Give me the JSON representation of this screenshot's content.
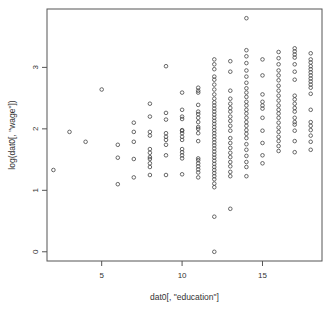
{
  "chart_data": {
    "type": "scatter",
    "title": "",
    "xlabel": "dat0[, \"education\"]",
    "ylabel": "log(dat0[, \"wage\"])",
    "xlim": [
      1.6,
      18.7
    ],
    "ylim": [
      -0.15,
      3.95
    ],
    "x_ticks": [
      5,
      10,
      15
    ],
    "x_tick_labels": [
      "5",
      "10",
      "15"
    ],
    "y_ticks": [
      0,
      1,
      2,
      3
    ],
    "y_tick_labels": [
      "0",
      "1",
      "2",
      "3"
    ],
    "grid": false,
    "legend": "none",
    "marker": "open-circle",
    "marker_color": "#444444",
    "points": [
      {
        "x": 2,
        "y": 1.33
      },
      {
        "x": 3,
        "y": 1.95
      },
      {
        "x": 4,
        "y": 1.79
      },
      {
        "x": 5,
        "y": 2.64
      },
      {
        "x": 6,
        "y": 1.74
      },
      {
        "x": 6,
        "y": 1.53
      },
      {
        "x": 6,
        "y": 1.1
      },
      {
        "x": 7,
        "y": 2.1
      },
      {
        "x": 7,
        "y": 1.95
      },
      {
        "x": 7,
        "y": 1.79
      },
      {
        "x": 7,
        "y": 1.51
      },
      {
        "x": 7,
        "y": 1.21
      },
      {
        "x": 8,
        "y": 2.41
      },
      {
        "x": 8,
        "y": 2.2
      },
      {
        "x": 8,
        "y": 1.95
      },
      {
        "x": 8,
        "y": 1.89
      },
      {
        "x": 8,
        "y": 1.67
      },
      {
        "x": 8,
        "y": 1.61
      },
      {
        "x": 8,
        "y": 1.54
      },
      {
        "x": 8,
        "y": 1.51
      },
      {
        "x": 8,
        "y": 1.44
      },
      {
        "x": 8,
        "y": 1.38
      },
      {
        "x": 8,
        "y": 1.25
      },
      {
        "x": 9,
        "y": 3.02
      },
      {
        "x": 9,
        "y": 2.26
      },
      {
        "x": 9,
        "y": 2.15
      },
      {
        "x": 9,
        "y": 1.93
      },
      {
        "x": 9,
        "y": 1.87
      },
      {
        "x": 9,
        "y": 1.82
      },
      {
        "x": 9,
        "y": 1.74
      },
      {
        "x": 9,
        "y": 1.57
      },
      {
        "x": 9,
        "y": 1.25
      },
      {
        "x": 10,
        "y": 2.59
      },
      {
        "x": 10,
        "y": 2.31
      },
      {
        "x": 10,
        "y": 2.2
      },
      {
        "x": 10,
        "y": 2.16
      },
      {
        "x": 10,
        "y": 1.98
      },
      {
        "x": 10,
        "y": 1.97
      },
      {
        "x": 10,
        "y": 1.93
      },
      {
        "x": 10,
        "y": 1.87
      },
      {
        "x": 10,
        "y": 1.82
      },
      {
        "x": 10,
        "y": 1.67
      },
      {
        "x": 10,
        "y": 1.62
      },
      {
        "x": 10,
        "y": 1.57
      },
      {
        "x": 10,
        "y": 1.52
      },
      {
        "x": 10,
        "y": 1.26
      },
      {
        "x": 11,
        "y": 2.67
      },
      {
        "x": 11,
        "y": 2.62
      },
      {
        "x": 11,
        "y": 2.59
      },
      {
        "x": 11,
        "y": 2.39
      },
      {
        "x": 11,
        "y": 2.28
      },
      {
        "x": 11,
        "y": 2.24
      },
      {
        "x": 11,
        "y": 2.18
      },
      {
        "x": 11,
        "y": 2.11
      },
      {
        "x": 11,
        "y": 2.03
      },
      {
        "x": 11,
        "y": 2.0
      },
      {
        "x": 11,
        "y": 1.93
      },
      {
        "x": 11,
        "y": 1.8
      },
      {
        "x": 11,
        "y": 1.52
      },
      {
        "x": 11,
        "y": 1.49
      },
      {
        "x": 11,
        "y": 1.44
      },
      {
        "x": 11,
        "y": 1.39
      },
      {
        "x": 11,
        "y": 1.34
      },
      {
        "x": 11,
        "y": 1.29
      },
      {
        "x": 11,
        "y": 1.21
      },
      {
        "x": 12,
        "y": 3.13
      },
      {
        "x": 12,
        "y": 3.05
      },
      {
        "x": 12,
        "y": 2.97
      },
      {
        "x": 12,
        "y": 2.85
      },
      {
        "x": 12,
        "y": 2.8
      },
      {
        "x": 12,
        "y": 2.72
      },
      {
        "x": 12,
        "y": 2.64
      },
      {
        "x": 12,
        "y": 2.56
      },
      {
        "x": 12,
        "y": 2.49
      },
      {
        "x": 12,
        "y": 2.43
      },
      {
        "x": 12,
        "y": 2.38
      },
      {
        "x": 12,
        "y": 2.33
      },
      {
        "x": 12,
        "y": 2.28
      },
      {
        "x": 12,
        "y": 2.23
      },
      {
        "x": 12,
        "y": 2.18
      },
      {
        "x": 12,
        "y": 2.13
      },
      {
        "x": 12,
        "y": 2.08
      },
      {
        "x": 12,
        "y": 2.03
      },
      {
        "x": 12,
        "y": 1.98
      },
      {
        "x": 12,
        "y": 1.93
      },
      {
        "x": 12,
        "y": 1.88
      },
      {
        "x": 12,
        "y": 1.83
      },
      {
        "x": 12,
        "y": 1.78
      },
      {
        "x": 12,
        "y": 1.73
      },
      {
        "x": 12,
        "y": 1.68
      },
      {
        "x": 12,
        "y": 1.63
      },
      {
        "x": 12,
        "y": 1.58
      },
      {
        "x": 12,
        "y": 1.53
      },
      {
        "x": 12,
        "y": 1.48
      },
      {
        "x": 12,
        "y": 1.43
      },
      {
        "x": 12,
        "y": 1.38
      },
      {
        "x": 12,
        "y": 1.33
      },
      {
        "x": 12,
        "y": 1.28
      },
      {
        "x": 12,
        "y": 1.23
      },
      {
        "x": 12,
        "y": 1.18
      },
      {
        "x": 12,
        "y": 1.11
      },
      {
        "x": 12,
        "y": 1.05
      },
      {
        "x": 12,
        "y": 0.57
      },
      {
        "x": 12,
        "y": 0.0
      },
      {
        "x": 13,
        "y": 3.1
      },
      {
        "x": 13,
        "y": 2.93
      },
      {
        "x": 13,
        "y": 2.62
      },
      {
        "x": 13,
        "y": 2.49
      },
      {
        "x": 13,
        "y": 2.41
      },
      {
        "x": 13,
        "y": 2.34
      },
      {
        "x": 13,
        "y": 2.28
      },
      {
        "x": 13,
        "y": 2.2
      },
      {
        "x": 13,
        "y": 2.13
      },
      {
        "x": 13,
        "y": 2.05
      },
      {
        "x": 13,
        "y": 1.97
      },
      {
        "x": 13,
        "y": 1.85
      },
      {
        "x": 13,
        "y": 1.77
      },
      {
        "x": 13,
        "y": 1.69
      },
      {
        "x": 13,
        "y": 1.61
      },
      {
        "x": 13,
        "y": 1.54
      },
      {
        "x": 13,
        "y": 1.46
      },
      {
        "x": 13,
        "y": 1.39
      },
      {
        "x": 13,
        "y": 1.3
      },
      {
        "x": 13,
        "y": 1.23
      },
      {
        "x": 13,
        "y": 0.7
      },
      {
        "x": 14,
        "y": 3.8
      },
      {
        "x": 14,
        "y": 3.28
      },
      {
        "x": 14,
        "y": 3.18
      },
      {
        "x": 14,
        "y": 3.07
      },
      {
        "x": 14,
        "y": 2.95
      },
      {
        "x": 14,
        "y": 2.85
      },
      {
        "x": 14,
        "y": 2.75
      },
      {
        "x": 14,
        "y": 2.66
      },
      {
        "x": 14,
        "y": 2.59
      },
      {
        "x": 14,
        "y": 2.52
      },
      {
        "x": 14,
        "y": 2.44
      },
      {
        "x": 14,
        "y": 2.38
      },
      {
        "x": 14,
        "y": 2.31
      },
      {
        "x": 14,
        "y": 2.25
      },
      {
        "x": 14,
        "y": 2.18
      },
      {
        "x": 14,
        "y": 2.11
      },
      {
        "x": 14,
        "y": 2.05
      },
      {
        "x": 14,
        "y": 1.98
      },
      {
        "x": 14,
        "y": 1.92
      },
      {
        "x": 14,
        "y": 1.85
      },
      {
        "x": 14,
        "y": 1.75
      },
      {
        "x": 14,
        "y": 1.66
      },
      {
        "x": 14,
        "y": 1.56
      },
      {
        "x": 14,
        "y": 1.46
      },
      {
        "x": 14,
        "y": 1.38
      },
      {
        "x": 14,
        "y": 1.23
      },
      {
        "x": 15,
        "y": 3.13
      },
      {
        "x": 15,
        "y": 2.87
      },
      {
        "x": 15,
        "y": 2.56
      },
      {
        "x": 15,
        "y": 2.44
      },
      {
        "x": 15,
        "y": 2.38
      },
      {
        "x": 15,
        "y": 2.33
      },
      {
        "x": 15,
        "y": 2.18
      },
      {
        "x": 15,
        "y": 1.97
      },
      {
        "x": 15,
        "y": 1.77
      },
      {
        "x": 15,
        "y": 1.57
      },
      {
        "x": 15,
        "y": 1.44
      },
      {
        "x": 16,
        "y": 3.25
      },
      {
        "x": 16,
        "y": 3.15
      },
      {
        "x": 16,
        "y": 3.05
      },
      {
        "x": 16,
        "y": 2.95
      },
      {
        "x": 16,
        "y": 2.87
      },
      {
        "x": 16,
        "y": 2.79
      },
      {
        "x": 16,
        "y": 2.7
      },
      {
        "x": 16,
        "y": 2.62
      },
      {
        "x": 16,
        "y": 2.54
      },
      {
        "x": 16,
        "y": 2.46
      },
      {
        "x": 16,
        "y": 2.38
      },
      {
        "x": 16,
        "y": 2.31
      },
      {
        "x": 16,
        "y": 2.25
      },
      {
        "x": 16,
        "y": 2.18
      },
      {
        "x": 16,
        "y": 2.1
      },
      {
        "x": 16,
        "y": 2.02
      },
      {
        "x": 16,
        "y": 1.95
      },
      {
        "x": 16,
        "y": 1.87
      },
      {
        "x": 16,
        "y": 1.8
      },
      {
        "x": 16,
        "y": 1.72
      },
      {
        "x": 16,
        "y": 1.64
      },
      {
        "x": 17,
        "y": 3.31
      },
      {
        "x": 17,
        "y": 3.26
      },
      {
        "x": 17,
        "y": 3.21
      },
      {
        "x": 17,
        "y": 3.16
      },
      {
        "x": 17,
        "y": 3.05
      },
      {
        "x": 17,
        "y": 2.93
      },
      {
        "x": 17,
        "y": 2.8
      },
      {
        "x": 17,
        "y": 2.54
      },
      {
        "x": 17,
        "y": 2.48
      },
      {
        "x": 17,
        "y": 2.41
      },
      {
        "x": 17,
        "y": 2.34
      },
      {
        "x": 17,
        "y": 2.28
      },
      {
        "x": 17,
        "y": 2.18
      },
      {
        "x": 17,
        "y": 2.11
      },
      {
        "x": 17,
        "y": 2.07
      },
      {
        "x": 17,
        "y": 1.97
      },
      {
        "x": 17,
        "y": 1.8
      },
      {
        "x": 17,
        "y": 1.62
      },
      {
        "x": 18,
        "y": 3.23
      },
      {
        "x": 18,
        "y": 3.13
      },
      {
        "x": 18,
        "y": 3.08
      },
      {
        "x": 18,
        "y": 3.02
      },
      {
        "x": 18,
        "y": 2.97
      },
      {
        "x": 18,
        "y": 2.92
      },
      {
        "x": 18,
        "y": 2.87
      },
      {
        "x": 18,
        "y": 2.82
      },
      {
        "x": 18,
        "y": 2.77
      },
      {
        "x": 18,
        "y": 2.72
      },
      {
        "x": 18,
        "y": 2.67
      },
      {
        "x": 18,
        "y": 2.57
      },
      {
        "x": 18,
        "y": 2.31
      },
      {
        "x": 18,
        "y": 2.11
      },
      {
        "x": 18,
        "y": 2.05
      },
      {
        "x": 18,
        "y": 1.98
      },
      {
        "x": 18,
        "y": 1.89
      },
      {
        "x": 18,
        "y": 1.79
      },
      {
        "x": 18,
        "y": 1.66
      }
    ]
  }
}
